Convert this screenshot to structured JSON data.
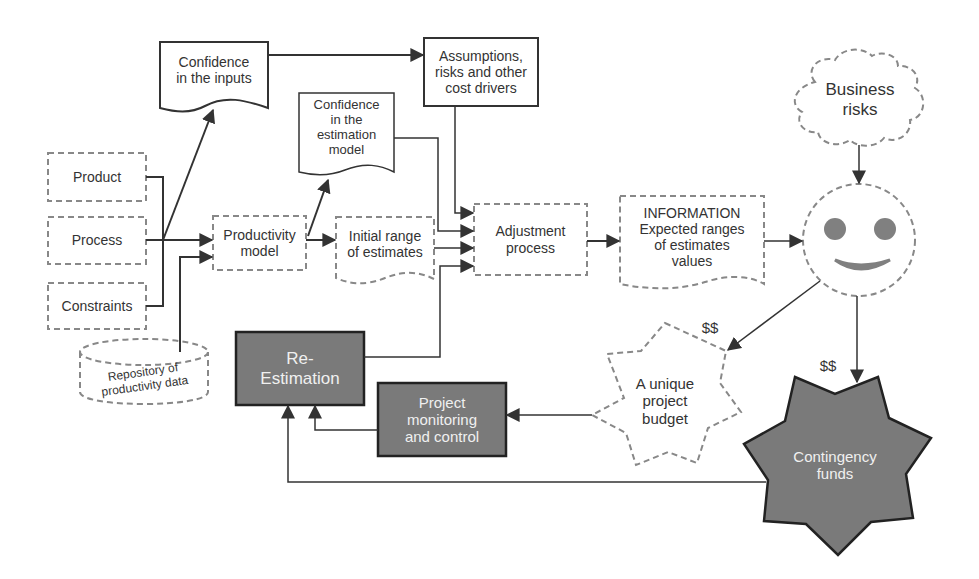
{
  "diagram": {
    "colors": {
      "line": "#333333",
      "dashed_border": "#888888",
      "dark_fill": "#7a7a7a",
      "face_features": "#808080"
    },
    "nodes": {
      "confidence_inputs": {
        "label": "Confidence\nin the inputs",
        "shape": "document"
      },
      "assumptions": {
        "label": "Assumptions,\nrisks and other\ncost drivers",
        "shape": "rectangle"
      },
      "confidence_model": {
        "label": "Confidence\nin the\nestimation\nmodel",
        "shape": "document"
      },
      "business_risks": {
        "label": "Business\nrisks",
        "shape": "cloud-dashed"
      },
      "product": {
        "label": "Product",
        "shape": "rectangle-dashed"
      },
      "process": {
        "label": "Process",
        "shape": "rectangle-dashed"
      },
      "constraints": {
        "label": "Constraints",
        "shape": "rectangle-dashed"
      },
      "productivity_model": {
        "label": "Productivity\nmodel",
        "shape": "rectangle-dashed"
      },
      "initial_range": {
        "label": "Initial range\nof estimates",
        "shape": "document-dashed"
      },
      "adjustment": {
        "label": "Adjustment\nprocess",
        "shape": "rectangle-dashed"
      },
      "information": {
        "label": "INFORMATION\nExpected ranges\nof estimates\nvalues",
        "shape": "document-dashed"
      },
      "decision_maker": {
        "label": "",
        "shape": "smiley-face"
      },
      "repository": {
        "label": "Repository of\nproductivity data",
        "shape": "cylinder-dashed"
      },
      "re_estimation": {
        "label": "Re-\nEstimation",
        "shape": "rectangle-filled"
      },
      "monitoring": {
        "label": "Project\nmonitoring\nand control",
        "shape": "rectangle-filled"
      },
      "unique_budget": {
        "label": "A unique\nproject\nbudget",
        "shape": "star-dashed"
      },
      "contingency": {
        "label": "Contingency\nfunds",
        "shape": "star-filled"
      }
    },
    "edge_labels": {
      "budget_money": "$$",
      "contingency_money": "$$"
    },
    "edges": [
      {
        "from": "product",
        "to": "productivity_model"
      },
      {
        "from": "process",
        "to": "productivity_model"
      },
      {
        "from": "constraints",
        "to": "productivity_model"
      },
      {
        "from": "inputs_junction",
        "to": "confidence_inputs"
      },
      {
        "from": "repository",
        "to": "productivity_model"
      },
      {
        "from": "confidence_inputs",
        "to": "assumptions"
      },
      {
        "from": "productivity_model",
        "to": "confidence_model"
      },
      {
        "from": "productivity_model",
        "to": "initial_range"
      },
      {
        "from": "assumptions",
        "to": "adjustment"
      },
      {
        "from": "confidence_model",
        "to": "adjustment"
      },
      {
        "from": "initial_range",
        "to": "adjustment"
      },
      {
        "from": "re_estimation",
        "to": "adjustment"
      },
      {
        "from": "adjustment",
        "to": "information"
      },
      {
        "from": "information",
        "to": "decision_maker"
      },
      {
        "from": "business_risks",
        "to": "decision_maker"
      },
      {
        "from": "decision_maker",
        "to": "unique_budget",
        "label": "$$"
      },
      {
        "from": "decision_maker",
        "to": "contingency",
        "label": "$$"
      },
      {
        "from": "unique_budget",
        "to": "monitoring"
      },
      {
        "from": "monitoring",
        "to": "re_estimation"
      },
      {
        "from": "contingency",
        "to": "re_estimation"
      }
    ]
  }
}
